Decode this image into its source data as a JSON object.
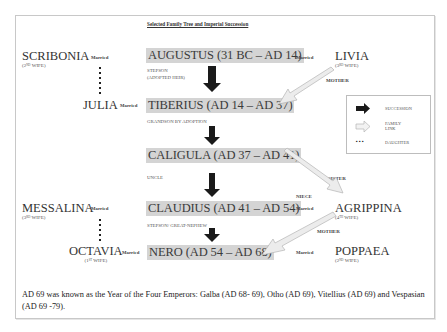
{
  "title": "Selected Family Tree and Imperial Succession",
  "emperors": [
    {
      "name": "AUGUSTUS (31 BC – AD 14)"
    },
    {
      "name": "TIBERIUS (AD 14 – AD 37)"
    },
    {
      "name": "CALIGULA (AD 37 – AD 41)"
    },
    {
      "name": "CLAUDIUS (AD 41 – AD 54)"
    },
    {
      "name": "NERO (AD 54 – AD 68)"
    }
  ],
  "succession_labels": {
    "augustus_to_tiberius_1": "STEPSON",
    "augustus_to_tiberius_2": "(ADOPTED HEIR)",
    "tiberius_to_caligula": "GRANDSON BY ADOPTION",
    "caligula_to_claudius": "UNCLE",
    "claudius_to_nero": "STEPSON/ GREAT-NEPHEW"
  },
  "people": {
    "scribonia": {
      "name": "SCRIBONIA",
      "ord": "2",
      "ord_sup": "ND",
      "role": " WIFE)"
    },
    "livia": {
      "name": "LIVIA",
      "ord": "3",
      "ord_sup": "RD",
      "role": " WIFE)"
    },
    "julia": {
      "name": "JULIA"
    },
    "messalina": {
      "name": "MESSALINA",
      "ord": "3",
      "ord_sup": "RD",
      "role": " WIFE)"
    },
    "agrippina": {
      "name": "AGRIPPINA",
      "ord": "4",
      "ord_sup": "TH",
      "role": " WIFE)"
    },
    "octavia": {
      "name": "OCTAVIA",
      "ord": "1",
      "ord_sup": "ST",
      "role": " WIFE)"
    },
    "poppaea": {
      "name": "POPPAEA",
      "ord": "2",
      "ord_sup": "ND",
      "role": " WIFE)"
    }
  },
  "married_label": "Married",
  "family_labels": {
    "livia_mother": "MOTHER",
    "sister": "SISTER",
    "niece": "NIECE",
    "agrippina_mother": "MOTHER"
  },
  "legend": {
    "items": [
      {
        "icon": "black-arrow",
        "label": "SUCCESSION"
      },
      {
        "icon": "outline-arrow",
        "label_1": "FAMILY",
        "label_2": "LINK"
      },
      {
        "icon": "dots",
        "symbol": "▪ ▪ ▪",
        "label": "DAUGHTER"
      }
    ]
  },
  "footer": "AD 69 was known as the Year of the Four Emperors: Galba (AD 68- 69), Otho (AD 69), Vitellius (AD 69) and Vespasian (AD 69 -79).",
  "colors": {
    "emperor_box": "#d4d4d4",
    "succession_arrow": "#1a1a1a",
    "family_arrow_fill": "#ececec",
    "family_arrow_stroke": "#b8b8b8"
  }
}
